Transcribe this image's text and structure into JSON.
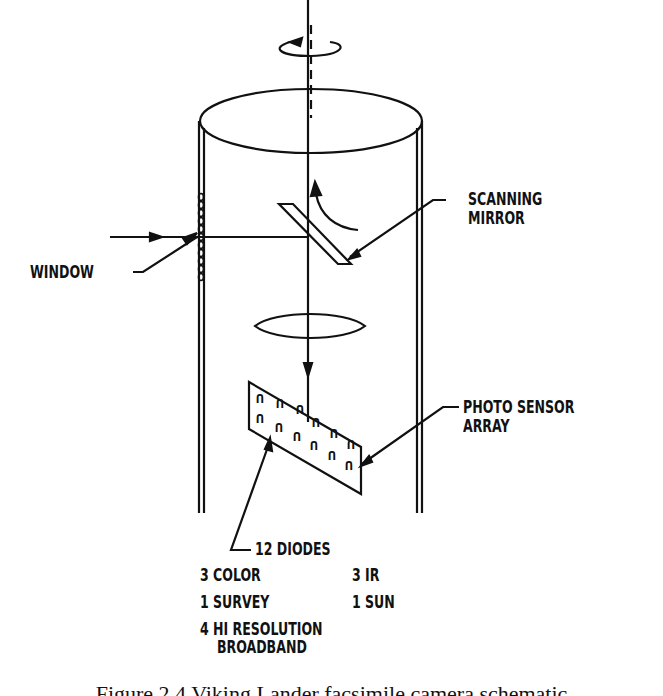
{
  "labels": {
    "scanning_mirror": [
      "SCANNING",
      "MIRROR"
    ],
    "window": "WINDOW",
    "photo_sensor_array": [
      "PHOTO SENSOR",
      "ARRAY"
    ],
    "diodes_title": "12 DIODES",
    "diodes_breakdown": [
      {
        "left": "3 COLOR",
        "right": "3 IR"
      },
      {
        "left": "1 SURVEY",
        "right": "1 SUN"
      },
      {
        "left": "4 HI RESOLUTION",
        "right": ""
      },
      {
        "left": "BROADBAND",
        "right": ""
      }
    ]
  },
  "caption": "Figure 2.4   Viking Lander facsimile camera schematic"
}
